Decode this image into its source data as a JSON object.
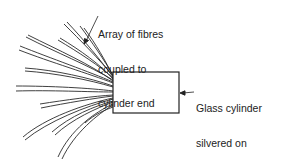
{
  "diagram": {
    "labels": {
      "fibres": {
        "lines": [
          "Array of fibres",
          "coupled to",
          "cylinder end"
        ]
      },
      "cylinder": {
        "lines": [
          "Glass cylinder",
          "silvered on",
          "sides and end"
        ]
      }
    },
    "colors": {
      "stroke": "#222222",
      "background": "#ffffff"
    }
  }
}
